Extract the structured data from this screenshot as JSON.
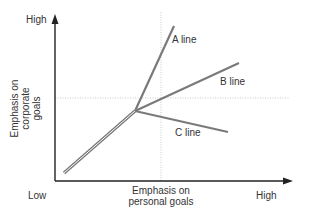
{
  "diagram": {
    "y_axis": {
      "high_label": "High",
      "title_lines": [
        "Emphasis on",
        "corporate",
        "goals"
      ]
    },
    "x_axis": {
      "low_label": "Low",
      "high_label": "High",
      "title_lines": [
        "Emphasis on",
        "personal goals"
      ]
    },
    "lines": [
      {
        "label": "A line"
      },
      {
        "label": "B line"
      },
      {
        "label": "C line"
      }
    ],
    "colors": {
      "axis": "#222222",
      "line": "#7a7a7a",
      "guide": "#bbbbbb"
    }
  }
}
